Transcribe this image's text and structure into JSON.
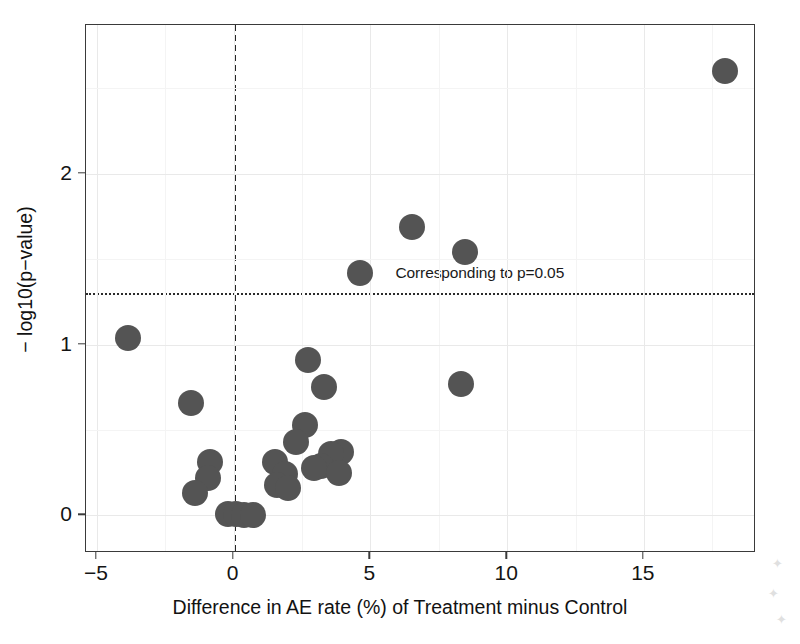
{
  "chart_data": {
    "type": "scatter",
    "title": "",
    "subtitle": "",
    "xlabel": "Difference in AE rate (%) of Treatment minus Control",
    "ylabel": "− log10(p−value)",
    "xlim": [
      -5.4,
      19.1
    ],
    "ylim": [
      -0.22,
      2.87
    ],
    "xticks": [
      -5,
      0,
      5,
      10,
      15
    ],
    "xticklabels": [
      "−5",
      "0",
      "5",
      "10",
      "15"
    ],
    "yticks": [
      0,
      1,
      2
    ],
    "yticklabels": [
      "0",
      "1",
      "2"
    ],
    "grid": true,
    "legend": "none",
    "marker_color": "#545454",
    "marker_size_px": 26,
    "reference_lines": [
      {
        "name": "null-effect-line",
        "orientation": "vertical",
        "value": 0,
        "style": "dashed",
        "color": "#262626",
        "label": ""
      },
      {
        "name": "significance-threshold-line",
        "orientation": "horizontal",
        "value": 1.301,
        "style": "dotted",
        "color": "#2b2b2b",
        "label": "Corresponding to p=0.05"
      }
    ],
    "annotations": [
      {
        "text": "Corresponding to p=0.05",
        "x": 9.0,
        "y": 1.42
      }
    ],
    "points": [
      {
        "x": 17.96,
        "y": 2.6
      },
      {
        "x": 6.53,
        "y": 1.69
      },
      {
        "x": 8.46,
        "y": 1.54
      },
      {
        "x": 4.63,
        "y": 1.42
      },
      {
        "x": -3.86,
        "y": 1.04
      },
      {
        "x": 2.71,
        "y": 0.91
      },
      {
        "x": 8.3,
        "y": 0.77
      },
      {
        "x": 3.29,
        "y": 0.75
      },
      {
        "x": -1.57,
        "y": 0.66
      },
      {
        "x": 2.62,
        "y": 0.53
      },
      {
        "x": 2.29,
        "y": 0.43
      },
      {
        "x": 3.93,
        "y": 0.37
      },
      {
        "x": 3.57,
        "y": 0.36
      },
      {
        "x": -0.86,
        "y": 0.31
      },
      {
        "x": 1.5,
        "y": 0.31
      },
      {
        "x": 3.21,
        "y": 0.29
      },
      {
        "x": 2.93,
        "y": 0.28
      },
      {
        "x": 3.86,
        "y": 0.25
      },
      {
        "x": 1.86,
        "y": 0.24
      },
      {
        "x": -0.93,
        "y": 0.22
      },
      {
        "x": 1.57,
        "y": 0.18
      },
      {
        "x": 2.0,
        "y": 0.16
      },
      {
        "x": -1.43,
        "y": 0.13
      },
      {
        "x": -0.21,
        "y": 0.01
      },
      {
        "x": 0.07,
        "y": 0.01
      },
      {
        "x": 0.36,
        "y": 0.0
      },
      {
        "x": 0.71,
        "y": 0.0
      }
    ],
    "n_points": 27
  },
  "axes": {
    "xlabel": "Difference in AE rate (%) of Treatment minus Control",
    "ylabel": "− log10(p−value)"
  }
}
